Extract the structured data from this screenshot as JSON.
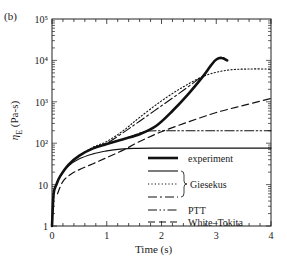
{
  "panel_label": "(b)",
  "chart_data": {
    "type": "line",
    "title": "",
    "xlabel": "Time (s)",
    "ylabel": "η_E (Pa·s)",
    "ylabel_display": "ηE (Pa-s)",
    "xlim": [
      0,
      4
    ],
    "ylim": [
      1,
      100000
    ],
    "yscale": "log",
    "grid": false,
    "x_ticks": [
      0,
      1,
      2,
      3,
      4
    ],
    "x_tick_labels": [
      "0",
      "1",
      "2",
      "3",
      "4"
    ],
    "y_ticks": [
      1,
      10,
      100,
      1000,
      10000,
      100000
    ],
    "y_tick_labels": [
      "1",
      "10",
      "10²",
      "10³",
      "10⁴",
      "10⁵"
    ],
    "legend_position": "lower right (inside)",
    "legend": [
      {
        "label": "experiment",
        "style": "thick-solid"
      },
      {
        "label": "Giesekus",
        "style": "solid",
        "group": "Giesekus"
      },
      {
        "label": "Giesekus",
        "style": "dotted",
        "group": "Giesekus"
      },
      {
        "label": "Giesekus",
        "style": "dash-dot",
        "group": "Giesekus"
      },
      {
        "label": "PTT",
        "style": "dash-dot-dot"
      },
      {
        "label": "White–Tokita",
        "style": "dashed"
      }
    ],
    "series": [
      {
        "name": "experiment",
        "style": "thick-solid",
        "x": [
          0.0,
          0.03,
          0.08,
          0.15,
          0.3,
          0.5,
          0.75,
          1.0,
          1.3,
          1.6,
          1.9,
          2.2,
          2.5,
          2.75,
          2.9,
          3.0,
          3.1,
          3.2
        ],
        "y": [
          1,
          6,
          10,
          16,
          30,
          50,
          75,
          95,
          125,
          165,
          260,
          600,
          1600,
          4000,
          7500,
          10500,
          11500,
          10000
        ]
      },
      {
        "name": "Giesekus (solid)",
        "style": "solid",
        "x": [
          0.0,
          0.03,
          0.08,
          0.15,
          0.3,
          0.5,
          0.75,
          1.0,
          1.25,
          1.5,
          2.0,
          3.0,
          4.0
        ],
        "y": [
          1,
          6,
          10,
          16,
          28,
          42,
          55,
          65,
          72,
          75,
          76,
          76,
          76
        ]
      },
      {
        "name": "Giesekus (dotted)",
        "style": "dotted",
        "x": [
          0.3,
          0.5,
          0.75,
          1.0,
          1.3,
          1.6,
          2.0,
          2.4,
          2.8,
          3.2,
          3.6,
          4.0
        ],
        "y": [
          30,
          50,
          80,
          110,
          200,
          420,
          1050,
          2300,
          4300,
          5800,
          6200,
          6200
        ]
      },
      {
        "name": "Giesekus (dash-dot)",
        "style": "dash-dot",
        "x": [
          0.75,
          1.0,
          1.3,
          1.6,
          2.0,
          2.4,
          2.75
        ],
        "y": [
          75,
          100,
          180,
          340,
          800,
          1900,
          4200
        ]
      },
      {
        "name": "PTT",
        "style": "dash-dot-dot",
        "x": [
          1.4,
          1.6,
          1.75,
          2.0,
          3.0,
          4.0
        ],
        "y": [
          140,
          175,
          195,
          200,
          200,
          200
        ]
      },
      {
        "name": "White–Tokita",
        "style": "dashed",
        "x": [
          0.1,
          0.2,
          0.35,
          0.5,
          0.75,
          1.0,
          1.3,
          1.6,
          2.0,
          2.5,
          3.0,
          3.5,
          4.0
        ],
        "y": [
          6,
          12,
          18,
          23,
          32,
          45,
          68,
          110,
          190,
          330,
          550,
          820,
          1200
        ]
      }
    ]
  },
  "plot_area": {
    "left": 52,
    "right": 271,
    "top": 19,
    "bottom": 226
  }
}
